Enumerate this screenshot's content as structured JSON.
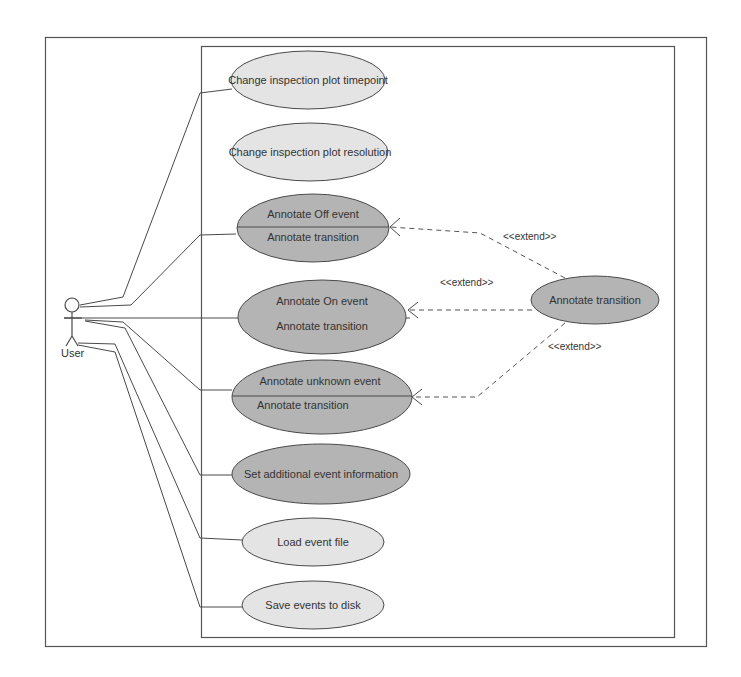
{
  "diagram": {
    "type": "UML use case diagram",
    "actor": {
      "name": "User"
    },
    "use_cases": [
      {
        "id": "uc1",
        "label": "Change inspection plot timepoint",
        "style": "light"
      },
      {
        "id": "uc2",
        "label": "Change inspection plot resolution",
        "style": "light"
      },
      {
        "id": "uc3",
        "label": "Annotate Off event",
        "extension_point": "Annotate transition",
        "style": "dark"
      },
      {
        "id": "uc4",
        "label": "Annotate On event",
        "extension_point": "Annotate transition",
        "style": "dark"
      },
      {
        "id": "uc5",
        "label": "Annotate unknown event",
        "extension_point": "Annotate transition",
        "style": "dark"
      },
      {
        "id": "uc6",
        "label": "Set additional event information",
        "style": "dark"
      },
      {
        "id": "uc7",
        "label": "Load event file",
        "style": "light"
      },
      {
        "id": "uc8",
        "label": "Save events to disk",
        "style": "light"
      },
      {
        "id": "uc9",
        "label": "Annotate transition",
        "style": "dark"
      }
    ],
    "relations": {
      "extend_label": "<<extend>>",
      "extend_1": "<<extend>>",
      "extend_2": "<<extend>>",
      "extend_3": "<<extend>>"
    },
    "colors": {
      "light_fill": "#e4e4e4",
      "dark_fill": "#b4b4b4",
      "stroke": "#4a4a4a",
      "text": "#333333",
      "background": "#ffffff"
    }
  }
}
